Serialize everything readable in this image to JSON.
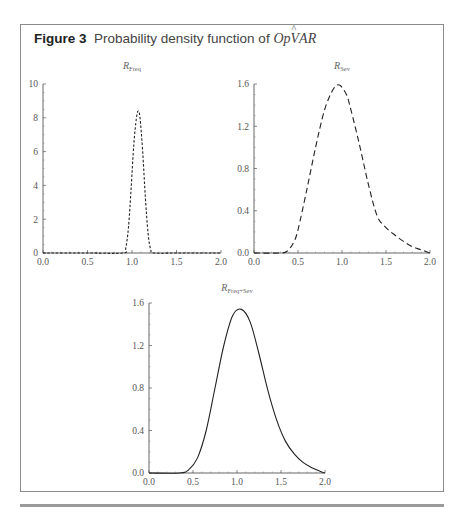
{
  "figure": {
    "label": "Figure 3",
    "title_text": "Probability density function of ",
    "title_var": "OpVAR",
    "title_var_prefix": "Op",
    "title_var_hat": "V",
    "title_var_suffix": "AR"
  },
  "chart_data": [
    {
      "type": "line",
      "title": "R_Freq",
      "title_main": "R",
      "title_sub": "Freq",
      "line_style": "dotted-dash",
      "xlabel": "",
      "ylabel": "",
      "xlim": [
        0.0,
        2.0
      ],
      "ylim": [
        0,
        10
      ],
      "x_ticks": [
        "0.0",
        "0.5",
        "1.0",
        "1.5",
        "2.0"
      ],
      "y_ticks": [
        "0",
        "2",
        "4",
        "6",
        "8",
        "10"
      ],
      "grid": false,
      "x": [
        0.0,
        0.5,
        0.9,
        0.93,
        0.96,
        0.99,
        1.02,
        1.05,
        1.07,
        1.09,
        1.12,
        1.15,
        1.18,
        1.21,
        1.25,
        1.5,
        2.0
      ],
      "y": [
        0.0,
        0.0,
        0.0,
        0.3,
        1.5,
        3.8,
        6.4,
        8.0,
        8.4,
        8.0,
        6.0,
        3.3,
        1.2,
        0.2,
        0.0,
        0.0,
        0.0
      ]
    },
    {
      "type": "line",
      "title": "R_Sev",
      "title_main": "R",
      "title_sub": "Sev",
      "line_style": "dashed",
      "xlabel": "",
      "ylabel": "",
      "xlim": [
        0.0,
        2.0
      ],
      "ylim": [
        0.0,
        1.6
      ],
      "x_ticks": [
        "0.0",
        "0.5",
        "1.0",
        "1.5",
        "2.0"
      ],
      "y_ticks": [
        "0.0",
        "0.4",
        "0.8",
        "1.2",
        "1.6"
      ],
      "grid": false,
      "x": [
        0.0,
        0.3,
        0.38,
        0.45,
        0.5,
        0.6,
        0.7,
        0.8,
        0.9,
        0.97,
        1.05,
        1.1,
        1.2,
        1.3,
        1.4,
        1.5,
        1.6,
        1.7,
        1.8,
        1.9,
        2.0
      ],
      "y": [
        0.0,
        0.0,
        0.02,
        0.1,
        0.22,
        0.6,
        1.0,
        1.35,
        1.55,
        1.59,
        1.5,
        1.36,
        1.02,
        0.65,
        0.35,
        0.24,
        0.17,
        0.11,
        0.06,
        0.03,
        0.0
      ]
    },
    {
      "type": "line",
      "title": "R_Freq+Sev",
      "title_main": "R",
      "title_sub": "Freq+Sev",
      "line_style": "solid",
      "xlabel": "",
      "ylabel": "",
      "xlim": [
        0.0,
        2.0
      ],
      "ylim": [
        0.0,
        1.6
      ],
      "x_ticks": [
        "0.0",
        "0.5",
        "1.0",
        "1.5",
        "2.0"
      ],
      "y_ticks": [
        "0.0",
        "0.4",
        "0.8",
        "1.2",
        "1.6"
      ],
      "grid": false,
      "x": [
        0.0,
        0.35,
        0.45,
        0.55,
        0.65,
        0.75,
        0.85,
        0.95,
        1.05,
        1.15,
        1.25,
        1.35,
        1.45,
        1.55,
        1.65,
        1.75,
        1.85,
        1.95,
        2.0
      ],
      "y": [
        0.0,
        0.0,
        0.03,
        0.14,
        0.4,
        0.8,
        1.2,
        1.48,
        1.54,
        1.42,
        1.12,
        0.78,
        0.5,
        0.3,
        0.18,
        0.1,
        0.05,
        0.015,
        0.0
      ]
    }
  ]
}
